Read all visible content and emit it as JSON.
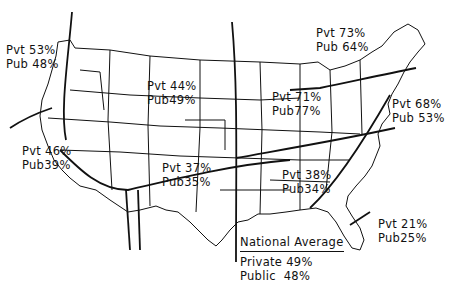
{
  "map": {
    "subject": "United States regional map",
    "regions": [
      {
        "id": "pacific-northwest",
        "private": "Pvt 53%",
        "public": "Pub 48%"
      },
      {
        "id": "mountain-north",
        "private": "Pvt 44%",
        "public": "Pub49%"
      },
      {
        "id": "northeast",
        "private": "Pvt 73%",
        "public": "Pub 64%"
      },
      {
        "id": "midwest",
        "private": "Pvt 71%",
        "public": "Pub77%"
      },
      {
        "id": "mid-atlantic",
        "private": "Pvt 68%",
        "public": "Pub 53%"
      },
      {
        "id": "southwest",
        "private": "Pvt 46%",
        "public": "Pub39%"
      },
      {
        "id": "south-central",
        "private": "Pvt 37%",
        "public": "Pub35%"
      },
      {
        "id": "southeast",
        "private": "Pvt 38%",
        "public": "Pub34%"
      },
      {
        "id": "florida",
        "private": "Pvt 21%",
        "public": "Pub25%"
      }
    ],
    "national_average": {
      "title": "National Average",
      "private": "Private 49%",
      "public": "Public  48%"
    }
  }
}
